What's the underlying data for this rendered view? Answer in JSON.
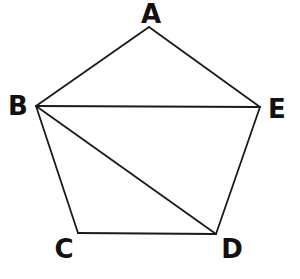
{
  "diagram": {
    "type": "geometry",
    "vertices": {
      "A": {
        "label": "A",
        "x": 149,
        "y": 27,
        "label_x": 151,
        "label_y": 14
      },
      "B": {
        "label": "B",
        "x": 36,
        "y": 106,
        "label_x": 18,
        "label_y": 106
      },
      "C": {
        "label": "C",
        "x": 78,
        "y": 233,
        "label_x": 64,
        "label_y": 249
      },
      "D": {
        "label": "D",
        "x": 216,
        "y": 234,
        "label_x": 232,
        "label_y": 249
      },
      "E": {
        "label": "E",
        "x": 260,
        "y": 107,
        "label_x": 277,
        "label_y": 109
      }
    },
    "edges": [
      {
        "name": "AB",
        "from": "A",
        "to": "B"
      },
      {
        "name": "AE",
        "from": "A",
        "to": "E"
      },
      {
        "name": "BE",
        "from": "B",
        "to": "E"
      },
      {
        "name": "BC",
        "from": "B",
        "to": "C"
      },
      {
        "name": "BD",
        "from": "B",
        "to": "D"
      },
      {
        "name": "CD",
        "from": "C",
        "to": "D"
      },
      {
        "name": "DE",
        "from": "D",
        "to": "E"
      }
    ],
    "colors": {
      "stroke": "#1a1a1a",
      "label": "#111111",
      "background": "#ffffff"
    }
  }
}
